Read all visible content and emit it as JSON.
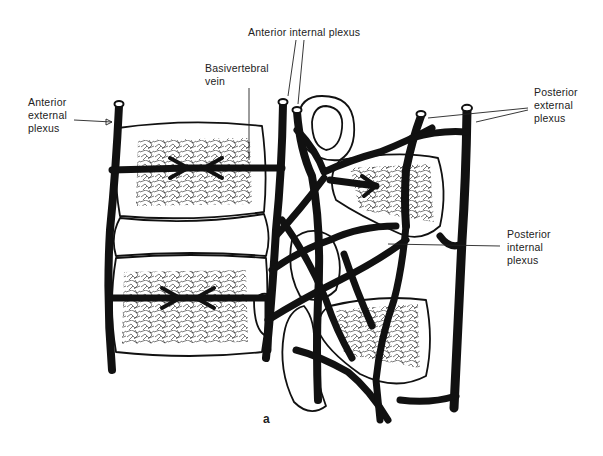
{
  "figure": {
    "caption": "a",
    "labels": {
      "anterior_external_plexus": "Anterior\nexternal\nplexus",
      "basivertebral_vein": "Basivertebral\nvein",
      "anterior_internal_plexus": "Anterior internal plexus",
      "posterior_external_plexus": "Posterior\nexternal\nplexus",
      "posterior_internal_plexus": "Posterior\ninternal\nplexus"
    },
    "colors": {
      "background": "#ffffff",
      "ink": "#111111"
    }
  }
}
